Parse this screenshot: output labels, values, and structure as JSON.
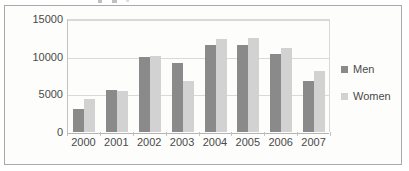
{
  "chart_data": {
    "type": "bar",
    "title": "",
    "xlabel": "",
    "ylabel": "",
    "categories": [
      "2000",
      "2001",
      "2002",
      "2003",
      "2004",
      "2005",
      "2006",
      "2007"
    ],
    "series": [
      {
        "name": "Men",
        "color": "#8a8a8a",
        "values": [
          3100,
          5600,
          10000,
          9100,
          11500,
          11500,
          10400,
          6800
        ]
      },
      {
        "name": "Women",
        "color": "#d2d2d2",
        "values": [
          4400,
          5500,
          10100,
          6800,
          12300,
          12500,
          11100,
          8100
        ]
      }
    ],
    "ylim": [
      0,
      15000
    ],
    "yticks": [
      "0",
      "5000",
      "10000",
      "15000"
    ],
    "ytick_values": [
      0,
      5000,
      10000,
      15000
    ],
    "grid": true,
    "legend_position": "right"
  },
  "legend": {
    "items": [
      {
        "label": "Men",
        "swatch_color": "#8a8a8a"
      },
      {
        "label": "Women",
        "swatch_color": "#d2d2d2"
      }
    ]
  },
  "colors": {
    "men": "#8a8a8a",
    "women": "#d2d2d2",
    "gridline": "#d9d9d9",
    "axis": "#b5b5b5",
    "frame_border": "#a9a9a9",
    "plot_background": "#fdfdfc",
    "tick_text": "#4a4a4a"
  }
}
